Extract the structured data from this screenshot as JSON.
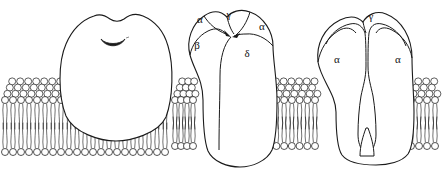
{
  "figure": {
    "background_color": "#ffffff",
    "stroke_color": "#1a1a1a",
    "fill_color": "#ffffff",
    "view": {
      "width": 443,
      "height": 180
    }
  },
  "panels": [
    {
      "id": "panel-left",
      "name": "receptor-extracellular-view",
      "caption": "",
      "features": [
        "dome",
        "central-pore-slit"
      ],
      "subunit_labels": []
    },
    {
      "id": "panel-middle",
      "name": "receptor-subunit-view",
      "caption": "",
      "features": [
        "five-subunits",
        "pore-arrows",
        "cytoplasmic-domain"
      ],
      "subunit_labels": [
        {
          "text": "α",
          "name": "subunit-alpha-left",
          "x": 200,
          "y": 23
        },
        {
          "text": "γ",
          "name": "subunit-gamma-top",
          "x": 229,
          "y": 18
        },
        {
          "text": "α",
          "name": "subunit-alpha-right",
          "x": 262,
          "y": 30
        },
        {
          "text": "β",
          "name": "subunit-beta",
          "x": 197,
          "y": 49
        },
        {
          "text": "δ",
          "name": "subunit-delta",
          "x": 247,
          "y": 57
        }
      ]
    },
    {
      "id": "panel-right",
      "name": "receptor-cross-section",
      "caption": "",
      "features": [
        "ion-channel-pore",
        "gate-constriction",
        "funnel-vestibule"
      ],
      "subunit_labels": [
        {
          "text": "γ",
          "name": "subunit-gamma-top",
          "x": 371,
          "y": 20
        },
        {
          "text": "α",
          "name": "subunit-alpha-left",
          "x": 337,
          "y": 63
        },
        {
          "text": "α",
          "name": "subunit-alpha-right",
          "x": 398,
          "y": 63
        }
      ]
    }
  ],
  "membrane": {
    "name": "lipid-bilayer",
    "head_shape": "circle",
    "tails_per_lipid": 2,
    "upper_leaflet_rows": 4,
    "lower_leaflet_rows": 1,
    "segments": [
      {
        "name": "bilayer-segment-left",
        "x_start": 2,
        "x_end": 168,
        "front_y": 100,
        "lower_y": 152,
        "cols": 21
      },
      {
        "name": "bilayer-segment-middle",
        "x_start": 172,
        "x_end": 196,
        "front_y": 100,
        "lower_y": 146,
        "cols": 4
      },
      {
        "name": "bilayer-segment-right",
        "x_start": 258,
        "x_end": 318,
        "front_y": 100,
        "lower_y": 146,
        "cols": 8
      },
      {
        "name": "bilayer-segment-far",
        "x_start": 408,
        "x_end": 438,
        "front_y": 100,
        "lower_y": 146,
        "cols": 4
      }
    ]
  }
}
